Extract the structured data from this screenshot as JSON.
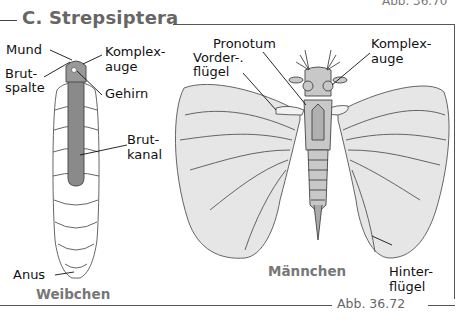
{
  "figure": {
    "top_caption": "Abb. 36.70",
    "title": "C. Strepsiptera",
    "caption": "Abb. 36.72"
  },
  "female": {
    "label": "Weibchen",
    "parts": {
      "mund": "Mund",
      "brutspalte_1": "Brut-",
      "brutspalte_2": "spalte",
      "komplexauge_1": "Komplex-",
      "komplexauge_2": "auge",
      "gehirn": "Gehirn",
      "brutkanal_1": "Brut-",
      "brutkanal_2": "kanal",
      "anus": "Anus"
    }
  },
  "male": {
    "label": "Männchen",
    "parts": {
      "pronotum": "Pronotum",
      "vorderfluegel_1": "Vorder-.",
      "vorderfluegel_2": "flügel",
      "komplexauge_1": "Komplex-",
      "komplexauge_2": "auge",
      "hinterfluegel_1": "Hinter-",
      "hinterfluegel_2": "flügel"
    }
  },
  "colors": {
    "wing_fill": "#e6e6e6",
    "body_fill": "#c8c8c8",
    "canal_fill": "#8a8a8a",
    "outline": "#444444",
    "title_gray": "#666666"
  }
}
